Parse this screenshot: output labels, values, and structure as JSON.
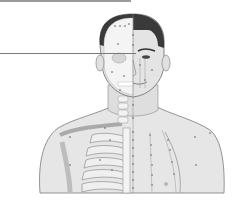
{
  "illustration": {
    "subject": "anatomical-acupuncture-chart-head-and-chest",
    "description": "Front view of male head and upper torso, left half showing skull/skeleton, right half showing skin, with dotted meridian point lines",
    "colors": {
      "background": "#ffffff",
      "skin": "#e6e6e6",
      "skin_shadow": "#cfcfcf",
      "hair": "#3a3a3a",
      "bone": "#f2f2f2",
      "outline": "#6a6a6a",
      "points": "#555555",
      "top_bar": "#9a9a9a",
      "pointer_line": "#7a7a7a"
    }
  }
}
